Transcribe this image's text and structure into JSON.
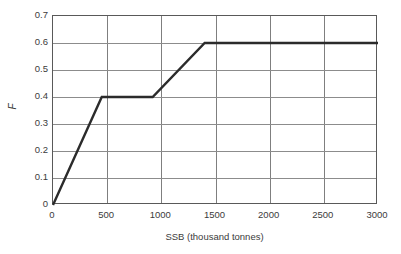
{
  "chart_data": {
    "type": "line",
    "title": "",
    "xlabel": "SSB (thousand tonnes)",
    "ylabel": "F",
    "xlim": [
      0,
      3000
    ],
    "ylim": [
      0,
      0.7
    ],
    "xticks": [
      0,
      500,
      1000,
      1500,
      2000,
      2500,
      3000
    ],
    "xtick_labels": [
      "0",
      "500",
      "1000",
      "1500",
      "2000",
      "2500",
      "3000"
    ],
    "yticks": [
      0,
      0.1,
      0.2,
      0.3,
      0.4,
      0.5,
      0.6,
      0.7
    ],
    "ytick_labels": [
      "0",
      "0.1",
      "0.2",
      "0.3",
      "0.4",
      "0.5",
      "0.6",
      "0.7"
    ],
    "grid": true,
    "legend": false,
    "series": [
      {
        "name": "Harvest control rule",
        "color": "#2b2b2b",
        "x": [
          0,
          450,
          920,
          1400,
          3000
        ],
        "values": [
          0,
          0.4,
          0.4,
          0.6,
          0.6
        ]
      }
    ]
  },
  "axes": {
    "x_title": "SSB (thousand tonnes)",
    "y_title": "F"
  }
}
